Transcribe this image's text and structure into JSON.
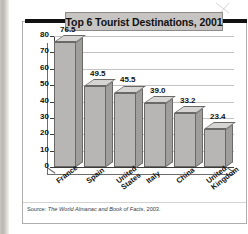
{
  "figure": {
    "title": "Top 6 Tourist Destinations, 2001",
    "source": "Source: ",
    "source_italic": "The World Almanac and Book of Facts",
    "source_tail": ", 2003."
  },
  "chart_data": {
    "type": "bar",
    "title": "Top 6 Tourist Destinations, 2001",
    "xlabel": "",
    "ylabel": "Millions of Tourists",
    "ylim": [
      0,
      80
    ],
    "ytick_step": 10,
    "yticks": [
      "0",
      "10",
      "20",
      "30",
      "40",
      "50",
      "60",
      "70",
      "80"
    ],
    "grid": true,
    "legend": "none",
    "three_d": true,
    "bar_color": "#b8b6b4",
    "categories": [
      "France",
      "Spain",
      "United States",
      "Italy",
      "China",
      "United Kingdom"
    ],
    "category_lines": [
      [
        "France"
      ],
      [
        "Spain"
      ],
      [
        "United",
        "States"
      ],
      [
        "Italy"
      ],
      [
        "China"
      ],
      [
        "United",
        "Kingdom"
      ]
    ],
    "values": [
      76.5,
      49.5,
      45.5,
      39.0,
      33.2,
      23.4
    ],
    "value_labels": [
      "76.5",
      "49.5",
      "45.5",
      "39.0",
      "33.2",
      "23.4"
    ]
  }
}
